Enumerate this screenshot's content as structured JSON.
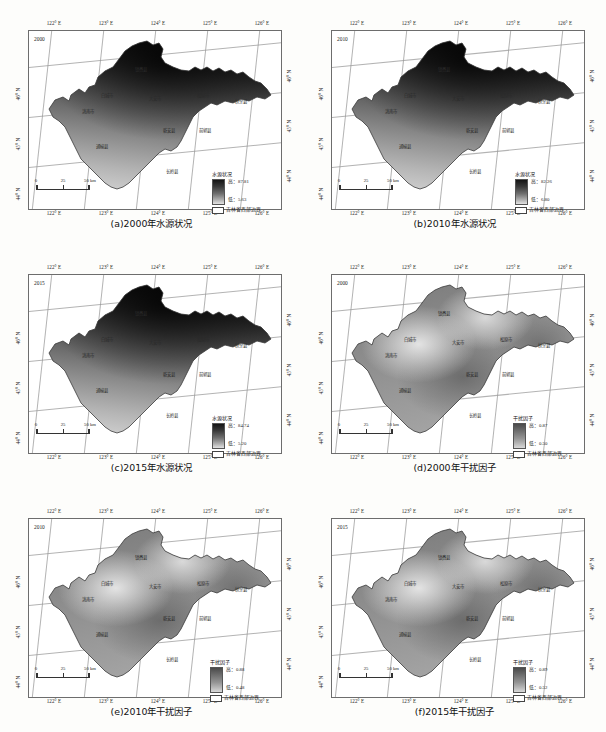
{
  "figure": {
    "axis_x_ticks": [
      "122° E",
      "123° E",
      "124° E",
      "125° E",
      "126° E"
    ],
    "axis_y_ticks": [
      "46° N",
      "45° N",
      "44° N"
    ],
    "axis_y_right_ticks": [
      "46° N",
      "45° N",
      "44° N"
    ],
    "scalebar": {
      "ticks": [
        "0",
        "25",
        "50 km"
      ]
    },
    "boundary_label": "吉林省西部边界",
    "high_prefix": "高",
    "low_prefix": "低",
    "cities": [
      "镇赉县",
      "白城市",
      "洮南市",
      "大安市",
      "松原市",
      "扶余县",
      "乾安县",
      "前郭县",
      "通榆县",
      "长岭县"
    ]
  },
  "panels": [
    {
      "id": "a",
      "caption": "(a)2000年水源状况",
      "year_label": "2000",
      "legend_title": "水源状况",
      "high": "高：87.81",
      "low": "低：5.63",
      "ramp": "water"
    },
    {
      "id": "b",
      "caption": "(b)2010年水源状况",
      "year_label": "2010",
      "legend_title": "水源状况",
      "high": "高：82.26",
      "low": "低：6.80",
      "ramp": "water"
    },
    {
      "id": "c",
      "caption": "(c)2015年水源状况",
      "year_label": "2015",
      "legend_title": "水源状况",
      "high": "高：84.74",
      "low": "低：5.20",
      "ramp": "water"
    },
    {
      "id": "d",
      "caption": "(d)2000年干扰因子",
      "year_label": "2000",
      "legend_title": "干扰因子",
      "high": "高：0.87",
      "low": "低：0.50",
      "ramp": "disturb"
    },
    {
      "id": "e",
      "caption": "(e)2010年干扰因子",
      "year_label": "2010",
      "legend_title": "干扰因子",
      "high": "高：0.88",
      "low": "低：0.48",
      "ramp": "disturb"
    },
    {
      "id": "f",
      "caption": "(f)2015年干扰因子",
      "year_label": "2015",
      "legend_title": "干扰因子",
      "high": "高：0.89",
      "low": "低：0.52",
      "ramp": "disturb"
    }
  ],
  "chart_data": {
    "type": "heatmap",
    "xlabel": "经度",
    "ylabel": "纬度",
    "xlim": [
      121.6,
      126.3
    ],
    "ylim": [
      43.6,
      46.4
    ],
    "grid": true,
    "legend_position": "bottom-right-inside",
    "panels": [
      {
        "id": "a",
        "variable": "水源状况",
        "year": 2000,
        "vmin": 5.63,
        "vmax": 87.81
      },
      {
        "id": "b",
        "variable": "水源状况",
        "year": 2010,
        "vmin": 6.8,
        "vmax": 82.26
      },
      {
        "id": "c",
        "variable": "水源状况",
        "year": 2015,
        "vmin": 5.2,
        "vmax": 84.74
      },
      {
        "id": "d",
        "variable": "干扰因子",
        "year": 2000,
        "vmin": 0.5,
        "vmax": 0.87
      },
      {
        "id": "e",
        "variable": "干扰因子",
        "year": 2010,
        "vmin": 0.48,
        "vmax": 0.88
      },
      {
        "id": "f",
        "variable": "干扰因子",
        "year": 2015,
        "vmin": 0.52,
        "vmax": 0.89
      }
    ],
    "colormap": "grayscale-dark-to-light"
  }
}
